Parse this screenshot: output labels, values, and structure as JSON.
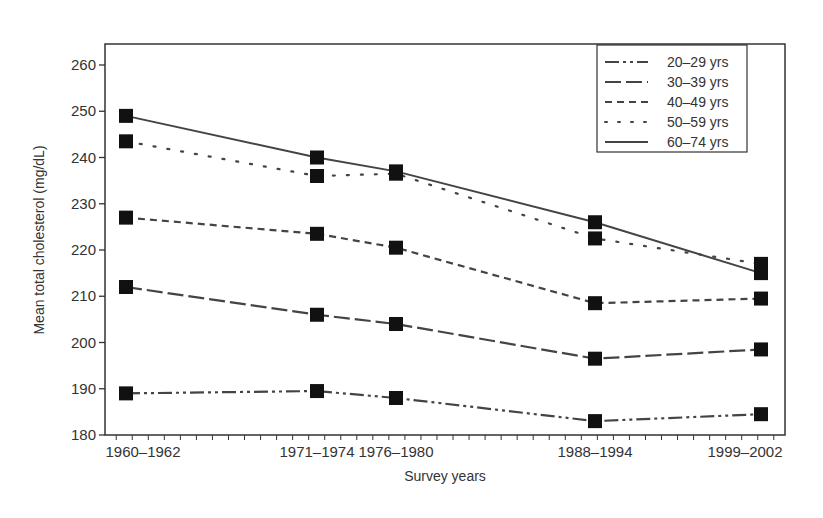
{
  "chart_data": {
    "type": "line",
    "title": "",
    "xlabel": "Survey years",
    "ylabel": "Mean total cholesterol (mg/dL)",
    "ylim": [
      180,
      260
    ],
    "yticks": [
      180,
      190,
      200,
      210,
      220,
      230,
      240,
      250,
      260
    ],
    "grid": false,
    "legend_position": "upper right",
    "categories": [
      "1960–1962",
      "1971–1974",
      "1976–1980",
      "1988–1994",
      "1999–2002"
    ],
    "x_positions_years": [
      1961,
      1972.5,
      1978,
      1991,
      2000.5
    ],
    "series": [
      {
        "name": "20–29 yrs",
        "style": "dash-dot-dot",
        "values": [
          189,
          189.5,
          188,
          183,
          184.5
        ]
      },
      {
        "name": "30–39 yrs",
        "style": "long-dash",
        "values": [
          212,
          206,
          204,
          196.5,
          198.5
        ]
      },
      {
        "name": "40–49 yrs",
        "style": "short-dash",
        "values": [
          227,
          223.5,
          220.5,
          208.5,
          209.5
        ]
      },
      {
        "name": "50–59 yrs",
        "style": "dotted",
        "values": [
          243.5,
          236,
          236.5,
          222.5,
          217
        ]
      },
      {
        "name": "60–74 yrs",
        "style": "solid",
        "values": [
          249,
          240,
          237,
          226,
          215
        ]
      }
    ]
  }
}
